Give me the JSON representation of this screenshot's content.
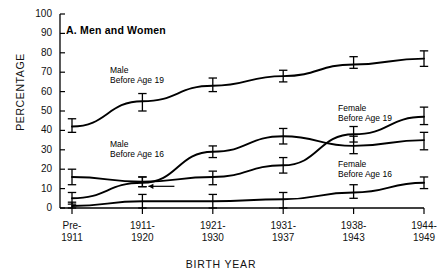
{
  "figure": {
    "panel_label": "A.  Men and Women",
    "xlabel": "BIRTH YEAR",
    "ylabel": "PERCENTAGE"
  },
  "annotations": [
    {
      "name": "male-before-19",
      "line1": "Male",
      "line2": "Before Age 19"
    },
    {
      "name": "male-before-16",
      "line1": "Male",
      "line2": "Before Age 16"
    },
    {
      "name": "female-before-19",
      "line1": "Female",
      "line2": "Before Age 19"
    },
    {
      "name": "female-before-16",
      "line1": "Female",
      "line2": "Before Age 16"
    }
  ],
  "chart_data": {
    "type": "line",
    "title": "A.  Men and Women",
    "xlabel": "BIRTH YEAR",
    "ylabel": "PERCENTAGE",
    "grid": false,
    "legend": "inline-annotations",
    "ylim": [
      0,
      100
    ],
    "yticks": [
      0,
      10,
      20,
      30,
      40,
      50,
      60,
      70,
      80,
      90,
      100
    ],
    "categories": [
      "Pre-1911",
      "1911-1920",
      "1921-1930",
      "1931-1937",
      "1938-1943",
      "1944-1949"
    ],
    "category_lines": [
      [
        "Pre-",
        "1911"
      ],
      [
        "1911-",
        "1920"
      ],
      [
        "1921-",
        "1930"
      ],
      [
        "1931-",
        "1937"
      ],
      [
        "1938-",
        "1943"
      ],
      [
        "1944-",
        "1949"
      ]
    ],
    "series": [
      {
        "name": "Male Before Age 19",
        "values": [
          42,
          55,
          63,
          68,
          74,
          77
        ],
        "err_low": [
          39,
          50,
          60,
          65,
          72,
          73
        ],
        "err_high": [
          46,
          59,
          67,
          71,
          78,
          81
        ]
      },
      {
        "name": "Male Before Age 16",
        "values": [
          5,
          13,
          29,
          37,
          32,
          35
        ],
        "err_low": [
          2,
          11,
          26,
          33,
          28,
          30
        ],
        "err_high": [
          8,
          16,
          32,
          41,
          37,
          39
        ]
      },
      {
        "name": "Female Before Age 19",
        "values": [
          16,
          13.5,
          16,
          22,
          38,
          47
        ],
        "err_low": [
          12,
          11,
          12,
          18,
          34,
          43
        ],
        "err_high": [
          20,
          16,
          19,
          26,
          42,
          52
        ]
      },
      {
        "name": "Female Before Age 16",
        "values": [
          1,
          3.5,
          3.5,
          4.5,
          8,
          13
        ],
        "err_low": [
          0,
          0,
          0,
          0,
          5,
          10
        ],
        "err_high": [
          3,
          7,
          7,
          8,
          12,
          16
        ]
      }
    ],
    "arrow_annotation": {
      "note": "leftward arrow pointing from 1921-1930-side marker toward 1911-1920 point",
      "value": 13.5
    }
  }
}
